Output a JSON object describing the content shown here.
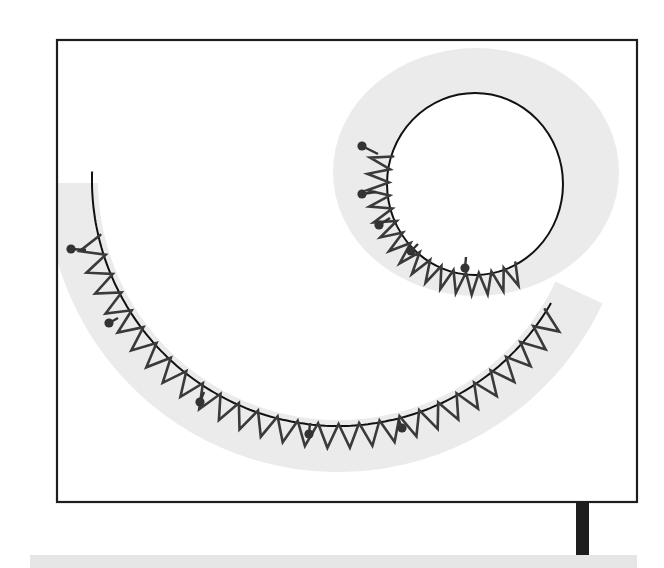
{
  "diagram": {
    "type": "sewing-stitch-illustration",
    "colors": {
      "background": "#ffffff",
      "frame": "#1e1e1e",
      "fabric_band": "#ebebeb",
      "guide_line": "#111111",
      "stitch": "#3a3a3a",
      "pin": "#333333",
      "post": "#1e1e1e",
      "base_strip": "#e6e6e6"
    },
    "frame": {
      "x": 57,
      "y": 40,
      "width": 580,
      "height": 462
    },
    "large_curve": {
      "label": "large-arc-seam",
      "center": [
        338,
        180
      ],
      "radius": 246,
      "start_angle_deg": 180,
      "end_angle_deg": 30,
      "band_width": 36,
      "zigzag_count": 28,
      "zigzag_depth": 22,
      "pin_count": 5
    },
    "small_circle": {
      "label": "small-circle-seam",
      "center": [
        475,
        184
      ],
      "radius_x": 88,
      "radius_y": 91,
      "band_outer": {
        "center": [
          476,
          172
        ],
        "rx": 143,
        "ry": 124
      },
      "zigzag_from_deg": 200,
      "zigzag_to_deg": 62,
      "zigzag_count": 16,
      "zigzag_depth": 20,
      "pin_count": 5
    },
    "stand": {
      "post": {
        "x": 576,
        "y": 503,
        "width": 13,
        "height": 52
      },
      "base_strip": {
        "x": 30,
        "y": 555,
        "width": 607,
        "height": 13
      }
    }
  }
}
